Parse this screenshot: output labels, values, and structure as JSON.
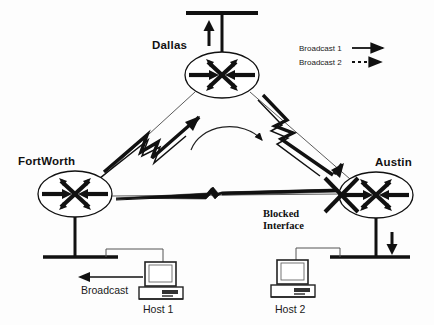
{
  "diagram": {
    "type": "network-topology",
    "background_color": "#fdfdfd",
    "line_color": "#111111"
  },
  "routers": [
    {
      "id": "dallas",
      "label": "Dallas",
      "icon": "router-icon",
      "cx": 222,
      "cy": 75,
      "rx": 37,
      "ry": 23
    },
    {
      "id": "fortworth",
      "label": "FortWorth",
      "icon": "router-icon",
      "cx": 75,
      "cy": 194,
      "rx": 37,
      "ry": 23
    },
    {
      "id": "austin",
      "label": "Austin",
      "icon": "router-icon",
      "cx": 376,
      "cy": 195,
      "rx": 37,
      "ry": 23
    }
  ],
  "hosts": [
    {
      "id": "host1",
      "label": "Host 1",
      "icon": "desktop-computer-icon",
      "x": 140,
      "y": 262
    },
    {
      "id": "host2",
      "label": "Host 2",
      "icon": "desktop-computer-icon",
      "x": 272,
      "y": 260
    }
  ],
  "annotations": {
    "blocked_interface": "Blocked\nInterface",
    "blocked_interface_line1": "Blocked",
    "blocked_interface_line2": "Interface",
    "blocked_marker_icon": "x-cross-icon",
    "broadcast": "Broadcast",
    "center_arc_icon": "curved-arrow-icon"
  },
  "legend": {
    "items": [
      {
        "label": "Broadcast 1",
        "style": "solid",
        "icon": "solid-arrow-icon"
      },
      {
        "label": "Broadcast 2",
        "style": "dashed",
        "icon": "dashed-arrow-icon"
      }
    ]
  },
  "links": [
    {
      "from": "fortworth",
      "to": "dallas",
      "style": "serial-lightning"
    },
    {
      "from": "dallas",
      "to": "austin",
      "style": "serial-lightning"
    },
    {
      "from": "fortworth",
      "to": "austin",
      "style": "serial-lightning",
      "state": "blocked"
    },
    {
      "from": "dallas",
      "to": "lan-top",
      "style": "ethernet"
    },
    {
      "from": "fortworth",
      "to": "lan-bottom-left",
      "style": "ethernet"
    },
    {
      "from": "austin",
      "to": "lan-bottom-right",
      "style": "ethernet"
    }
  ],
  "flow_arrows": [
    {
      "id": "fw-to-dallas",
      "direction": "up-right",
      "weight": "thick"
    },
    {
      "id": "dallas-to-austin",
      "direction": "down-right",
      "weight": "thick"
    },
    {
      "id": "dallas-lan-up",
      "direction": "up",
      "weight": "thick"
    },
    {
      "id": "austin-lan-down",
      "direction": "down",
      "weight": "thick"
    },
    {
      "id": "host1-broadcast",
      "direction": "left",
      "weight": "thin"
    },
    {
      "id": "center-arc",
      "direction": "clockwise",
      "weight": "thin"
    }
  ]
}
